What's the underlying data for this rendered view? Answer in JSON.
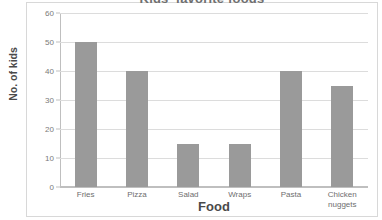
{
  "chart_data": {
    "type": "bar",
    "title": "Kids' favorite foods",
    "xlabel": "Food",
    "ylabel": "No. of kids",
    "categories": [
      "Fries",
      "Pizza",
      "Salad",
      "Wraps",
      "Pasta",
      "Chicken nuggets"
    ],
    "category_lines": [
      [
        "Fries"
      ],
      [
        "Pizza"
      ],
      [
        "Salad"
      ],
      [
        "Wraps"
      ],
      [
        "Pasta"
      ],
      [
        "Chicken",
        "nuggets"
      ]
    ],
    "values": [
      50,
      40,
      15,
      15,
      40,
      35
    ],
    "ylim": [
      0,
      60
    ],
    "ytick_labels": [
      "60",
      "50",
      "40",
      "30",
      "20",
      "10",
      "0"
    ],
    "ytick_values": [
      60,
      50,
      40,
      30,
      20,
      10,
      0
    ],
    "ytick_step": 10,
    "grid": true,
    "legend": false,
    "bar_color": "#9a9a9a",
    "gridline_color": "#dcdcdc",
    "axis_color": "#bfbfbf",
    "frame_color": "#d8d8d8",
    "title_color": "#6f6f6f",
    "label_color": "#4a4a4a",
    "tick_color": "#7a7a7a"
  }
}
